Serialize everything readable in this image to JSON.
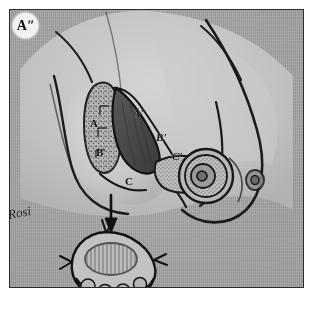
{
  "figure": {
    "panel_badge": "Aʺ",
    "caption_note": "Rosi",
    "medium": "pencil and ink drawing on gray paper"
  },
  "colors": {
    "paper": "#c9c9c9",
    "frame": "#2b2b2b",
    "ink": "#141414",
    "shade_dark": "#4a4a4a",
    "stipple": "#6f6f6f",
    "badge_bg": "#f2f2f2"
  },
  "labels": {
    "left_column": [
      {
        "id": "A",
        "text": "A",
        "x": 90,
        "y": 117
      },
      {
        "id": "B",
        "text": "B",
        "x": 96,
        "y": 146
      },
      {
        "id": "C",
        "text": "C",
        "x": 125,
        "y": 175
      }
    ],
    "right_column": [
      {
        "id": "A-prime",
        "text": "A'",
        "x": 133,
        "y": 107
      },
      {
        "id": "B-prime",
        "text": "B'",
        "x": 156,
        "y": 131
      },
      {
        "id": "C-prime",
        "text": "C'",
        "x": 172,
        "y": 150
      }
    ]
  },
  "annotations": {
    "arrow": {
      "name": "downward-arrow",
      "direction": "down",
      "meaning": "excised tissue transferred below"
    }
  },
  "regions": [
    {
      "name": "stippled-flap",
      "description": "stippled dermal flap region between A-B and A'-B'"
    },
    {
      "name": "excision-wedge",
      "description": "dark shaded triangular wedge of tissue to be removed"
    },
    {
      "name": "areola",
      "description": "nipple areola complex drawn as concentric circles with stipple"
    },
    {
      "name": "excised-specimen",
      "description": "resected specimen with hatched oval and suture tags"
    }
  ]
}
